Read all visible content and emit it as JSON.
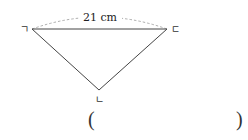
{
  "figure": {
    "vertices": [
      {
        "label": "ㄱ",
        "x": 32,
        "y": 29
      },
      {
        "label": "ㄷ",
        "x": 167,
        "y": 29
      },
      {
        "label": "ㄴ",
        "x": 99,
        "y": 90
      }
    ],
    "measure": {
      "text": "21 cm",
      "between": [
        "ㄱ",
        "ㄷ"
      ]
    },
    "line_color": "#444444",
    "dash_color": "#888888"
  },
  "answer": {
    "open_paren": "(",
    "close_paren": ")",
    "value": ""
  }
}
